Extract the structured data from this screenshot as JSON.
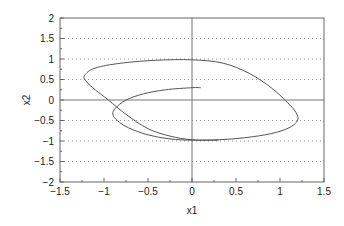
{
  "chart_data": {
    "type": "line",
    "title": "",
    "xlabel": "x1",
    "ylabel": "x2",
    "xlim": [
      -1.5,
      1.5
    ],
    "ylim": [
      -2,
      2
    ],
    "xticks": [
      -1.5,
      -1,
      -0.5,
      0,
      0.5,
      1,
      1.5
    ],
    "xtick_labels": [
      "−1.5",
      "−1",
      "−0.5",
      "0",
      "0.5",
      "1",
      "1.5"
    ],
    "yticks": [
      2,
      1.5,
      1,
      0.5,
      0,
      -0.5,
      -1,
      -1.5,
      -2
    ],
    "ytick_labels": [
      "2",
      "1.5",
      "1",
      "0.5",
      "0",
      "−0.5",
      "−1",
      "−1.5",
      "−2"
    ],
    "grid": "horizontal dotted",
    "legend": null,
    "series": [
      {
        "name": "trajectory",
        "color": "#555555",
        "x": [
          0.1,
          0.0,
          -0.3,
          -0.55,
          -0.75,
          -0.87,
          -0.9,
          -0.85,
          -0.72,
          -0.5,
          -0.25,
          0.0,
          0.3,
          0.6,
          0.9,
          1.1,
          1.2,
          1.18,
          1.08,
          0.9,
          0.65,
          0.35,
          0.0,
          -0.4,
          -0.8,
          -1.1,
          -1.22,
          -1.2,
          -1.1,
          -0.95,
          -0.75,
          -0.5,
          -0.25,
          0.0,
          0.3
        ],
        "y": [
          0.3,
          0.3,
          0.25,
          0.15,
          0.0,
          -0.2,
          -0.35,
          -0.5,
          -0.68,
          -0.85,
          -0.95,
          -0.98,
          -0.97,
          -0.92,
          -0.82,
          -0.68,
          -0.5,
          -0.3,
          -0.05,
          0.3,
          0.65,
          0.9,
          0.98,
          0.97,
          0.9,
          0.78,
          0.6,
          0.45,
          0.25,
          0.0,
          -0.35,
          -0.7,
          -0.88,
          -0.97,
          -0.98
        ]
      }
    ]
  },
  "axes": {
    "xlabel": "x1",
    "ylabel": "x2"
  }
}
